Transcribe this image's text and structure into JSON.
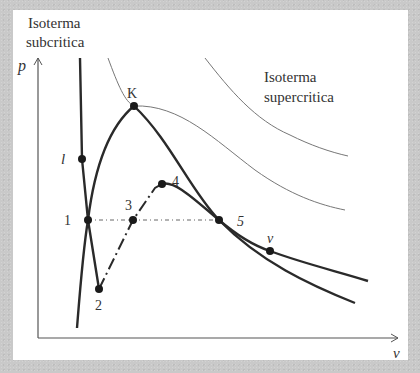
{
  "labels": {
    "subcritical": [
      "Isoterma",
      "subcritica"
    ],
    "supercritical": [
      "Isoterma",
      "supercritica"
    ],
    "y_axis": "p",
    "x_axis": "v",
    "critical_point": "K",
    "point_l": "l",
    "point_v": "v",
    "point_1": "1",
    "point_2": "2",
    "point_3": "3",
    "point_4": "4",
    "point_5": "5"
  },
  "colors": {
    "thick_curve": "#2a2a2a",
    "thin_curve": "#777777",
    "axis": "#555555",
    "point": "#1a1a1a",
    "background": "#c9c9c9",
    "panel": "#ffffff"
  },
  "geometry": {
    "axes": {
      "origin": [
        38,
        338
      ],
      "y_top": [
        38,
        58
      ],
      "x_end": [
        398,
        338
      ]
    },
    "points": {
      "K": [
        134,
        106
      ],
      "l": [
        82,
        159
      ],
      "p1": [
        88,
        220
      ],
      "p2": [
        99,
        289
      ],
      "p3": [
        133,
        220
      ],
      "p4": [
        162,
        184
      ],
      "p5": [
        219,
        220
      ],
      "v": [
        270,
        251
      ]
    },
    "paths": {
      "subcritical_isotherm": "M 80 58 L 82 159 L 88 220 L 99 289",
      "subcritical_liquid_tail": "M 77 328 C 80 290 83 250 88 220 C 93 180 105 130 134 106",
      "saturation_dome_right": "M 134 106 C 170 140 190 190 219 220 C 260 262 310 285 355 303",
      "metastable_vapor": "M 162 184 C 175 180 195 200 219 220 C 240 238 255 246 270 251 C 305 264 340 272 368 281",
      "isotherm_critical": "M 108 58 C 118 85 125 102 134 106 C 180 104 215 140 255 170 C 290 195 320 205 345 210",
      "isotherm_supercritical": "M 205 58 C 230 90 255 120 290 135 C 310 145 330 152 348 156",
      "unstable_branch": "M 99 289 L 133 220 L 155 188 L 162 184",
      "horizontal_tie": "M 88 220 L 219 220"
    }
  }
}
